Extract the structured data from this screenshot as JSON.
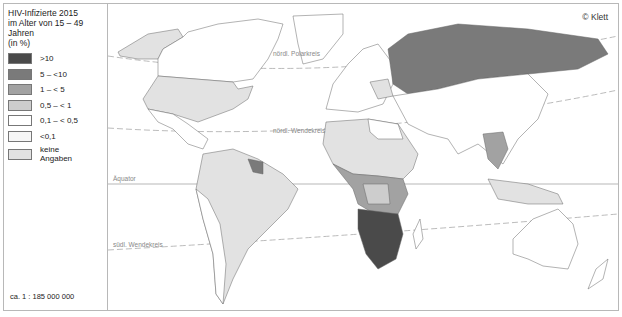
{
  "legend": {
    "title_lines": [
      "HIV-Infizierte 2015",
      "im Alter von 15 – 49 Jahren",
      "(in %)"
    ],
    "items": [
      {
        "label": ">10",
        "color": "#4a4a4a"
      },
      {
        "label": "5   – <10",
        "color": "#7a7a7a"
      },
      {
        "label": "1   – < 5",
        "color": "#a2a2a2"
      },
      {
        "label": "0,5 – < 1",
        "color": "#cdcdcd"
      },
      {
        "label": "0,1 – < 0,5",
        "color": "#ffffff"
      },
      {
        "label": "<0,1",
        "color": "#f6f6f6"
      },
      {
        "label": "keine Angaben",
        "color": "#e2e2e2"
      }
    ],
    "scale": "ca. 1 : 185 000 000"
  },
  "map": {
    "copyright": "© Klett",
    "lines": {
      "polar": "nördl. Polarkreis",
      "tropic_north": "nördl. Wendekreis",
      "equator": "Äquator",
      "tropic_south": "südl. Wendekreis"
    }
  }
}
